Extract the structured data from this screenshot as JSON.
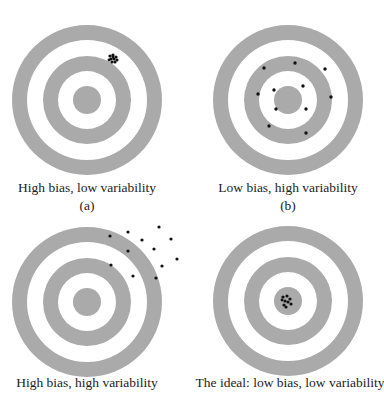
{
  "colors": {
    "ring": "#aaaaaa",
    "background": "#ffffff",
    "shot": "#111111",
    "text": "#222222"
  },
  "panels": [
    {
      "id": "a",
      "caption": "High bias, low variability",
      "sublabel": "(a)",
      "center": [
        87,
        100
      ],
      "shots": "tight cluster off-center upper right",
      "cluster_center": [
        113,
        58
      ]
    },
    {
      "id": "b",
      "caption": "Low bias, high variability",
      "sublabel": "(b)",
      "center": [
        288,
        100
      ],
      "shots": "widely scattered around center",
      "points": [
        [
          264,
          68
        ],
        [
          295,
          63
        ],
        [
          325,
          69
        ],
        [
          258,
          94
        ],
        [
          274,
          90
        ],
        [
          303,
          86
        ],
        [
          331,
          97
        ],
        [
          276,
          109
        ],
        [
          306,
          109
        ],
        [
          269,
          126
        ],
        [
          306,
          133
        ]
      ]
    },
    {
      "id": "c",
      "caption": "High bias, high variability",
      "sublabel": "",
      "center": [
        87,
        302
      ],
      "shots": "widely scattered off-center upper right",
      "points": [
        [
          159,
          227
        ],
        [
          110,
          236
        ],
        [
          128,
          232
        ],
        [
          142,
          240
        ],
        [
          171,
          239
        ],
        [
          128,
          251
        ],
        [
          154,
          249
        ],
        [
          177,
          259
        ],
        [
          111,
          265
        ],
        [
          162,
          266
        ],
        [
          133,
          276
        ],
        [
          156,
          278
        ]
      ]
    },
    {
      "id": "d",
      "caption": "The ideal: low bias, low variability",
      "sublabel": "",
      "center": [
        288,
        301
      ],
      "shots": "tight cluster at bullseye",
      "cluster_center": [
        286,
        301
      ]
    }
  ],
  "ring_radii": {
    "outer": 75,
    "outer_inner": 60,
    "middle": 44,
    "middle_inner": 29,
    "bullseye": 14
  }
}
